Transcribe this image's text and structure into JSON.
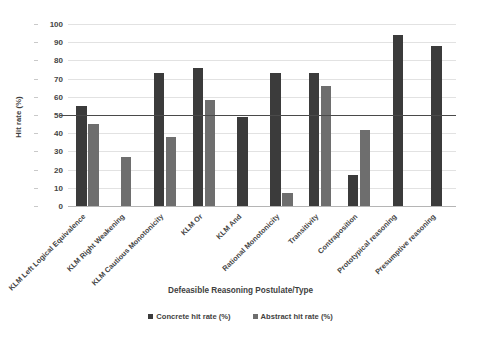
{
  "chart_data": {
    "type": "bar",
    "title": "",
    "xlabel": "Defeasible Reasoning Postulate/Type",
    "ylabel": "Hit rate (%)",
    "ylim": [
      0,
      100
    ],
    "yticks": [
      0,
      10,
      20,
      30,
      40,
      50,
      60,
      70,
      80,
      90,
      100
    ],
    "grid": true,
    "legend_position": "bottom",
    "reference_line": 50,
    "categories": [
      "KLM Left Logical Equivalence",
      "KLM Right Weakening",
      "KLM Cautious Monotonicity",
      "KLM Or",
      "KLM And",
      "Rational Monotonicity",
      "Transitivity",
      "Contraposition",
      "Prototypical reasoning",
      "Presumptive reasoning"
    ],
    "series": [
      {
        "name": "Concrete hit rate (%)",
        "color": "#3b3b3b",
        "values": [
          55,
          null,
          73,
          76,
          49,
          73,
          73,
          17,
          94,
          88
        ]
      },
      {
        "name": "Abstract hit rate (%)",
        "color": "#6e6e6e",
        "values": [
          45,
          27,
          38,
          58,
          null,
          7,
          66,
          42,
          null,
          null
        ]
      }
    ]
  },
  "legend": {
    "items": [
      {
        "label": "Concrete hit rate (%)",
        "swatch": "concrete"
      },
      {
        "label": "Abstract hit rate (%)",
        "swatch": "abstract"
      }
    ]
  }
}
